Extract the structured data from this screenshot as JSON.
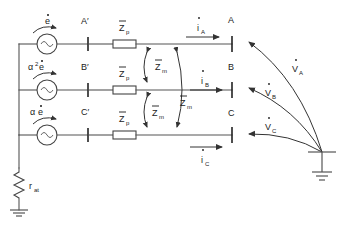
{
  "diagram": {
    "colors": {
      "wire": "#555555",
      "label": "#1a1a1a",
      "arrow": "#333333",
      "background": "#ffffff"
    },
    "sources": [
      {
        "id": "phase-a",
        "label_base": "e",
        "coefficient": "",
        "exponent": "",
        "has_dot": true
      },
      {
        "id": "phase-b",
        "label_base": "e",
        "coefficient": "α",
        "exponent": "2",
        "has_dot": true
      },
      {
        "id": "phase-c",
        "label_base": "e",
        "coefficient": "α",
        "exponent": "",
        "has_dot": true
      }
    ],
    "source_labels": {
      "a": "ė",
      "b": "α²ė",
      "c": "αė"
    },
    "inner_terminals": [
      {
        "id": "a-prime",
        "label": "A′"
      },
      {
        "id": "b-prime",
        "label": "B′"
      },
      {
        "id": "c-prime",
        "label": "C′"
      }
    ],
    "outer_terminals": [
      {
        "id": "a",
        "label": "A"
      },
      {
        "id": "b",
        "label": "B"
      },
      {
        "id": "c",
        "label": "C"
      }
    ],
    "series_impedances": [
      {
        "id": "zp-a",
        "base": "Z",
        "sub": "p"
      },
      {
        "id": "zp-b",
        "base": "Z",
        "sub": "p"
      },
      {
        "id": "zp-c",
        "base": "Z",
        "sub": "p"
      }
    ],
    "mutual_impedances": [
      {
        "id": "zm-ab",
        "base": "Z",
        "sub": "m"
      },
      {
        "id": "zm-bc",
        "base": "Z",
        "sub": "m"
      },
      {
        "id": "zm-ac",
        "base": "Z",
        "sub": "m"
      }
    ],
    "currents": [
      {
        "id": "i-a",
        "base": "i",
        "sub": "A",
        "direction": "right"
      },
      {
        "id": "i-b",
        "base": "i",
        "sub": "B",
        "direction": "right"
      },
      {
        "id": "i-c",
        "base": "i",
        "sub": "C",
        "direction": "right"
      }
    ],
    "voltages": [
      {
        "id": "v-a",
        "base": "V",
        "sub": "A",
        "direction": "left"
      },
      {
        "id": "v-b",
        "base": "V",
        "sub": "B",
        "direction": "left"
      },
      {
        "id": "v-c",
        "base": "V",
        "sub": "C",
        "direction": "left"
      }
    ],
    "neutral_resistor": {
      "id": "r-at",
      "base": "r",
      "sub": "at"
    },
    "grounds": [
      {
        "id": "source-ground"
      },
      {
        "id": "load-ground"
      }
    ]
  }
}
